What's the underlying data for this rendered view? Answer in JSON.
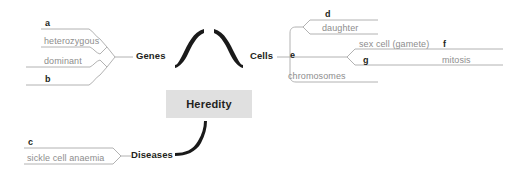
{
  "diagram": {
    "type": "mind-map",
    "title": "Heredity",
    "center": {
      "label": "Heredity",
      "fill": "#e0e0e0",
      "text_color": "#231f20"
    },
    "colors": {
      "center_fill": "#e0e0e0",
      "main_connector": "#1a1a1a",
      "leaf_line": "#a9a9a9",
      "leaf_text": "#8d8d8d",
      "main_text": "#231f20",
      "background": "#ffffff"
    },
    "branches": [
      {
        "label": "Genes",
        "side": "left",
        "children": [
          {
            "marker": "a",
            "text": "",
            "style": "marker-above"
          },
          {
            "marker": "",
            "text": "heterozygous",
            "style": "leaf"
          },
          {
            "marker": "",
            "text": "dominant",
            "style": "leaf"
          },
          {
            "marker": "b",
            "text": "",
            "style": "marker-below"
          }
        ]
      },
      {
        "label": "Cells",
        "side": "right",
        "children": [
          {
            "marker": "d",
            "text": "",
            "style": "marker-above"
          },
          {
            "marker": "",
            "text": "daughter",
            "style": "leaf"
          },
          {
            "marker": "e",
            "text": "",
            "style": "marker"
          },
          {
            "marker": "",
            "text": "chromosomes",
            "style": "leaf"
          }
        ],
        "nested": {
          "parent_marker": "e",
          "children": [
            {
              "marker": "f",
              "text": "sex cell (gamete)",
              "style": "leaf-then-marker"
            },
            {
              "marker": "g",
              "text": "mitosis",
              "style": "marker-then-leaf"
            }
          ]
        }
      },
      {
        "label": "Diseases",
        "side": "left",
        "children": [
          {
            "marker": "c",
            "text": "",
            "style": "marker-above"
          },
          {
            "marker": "",
            "text": "sickle cell anaemia",
            "style": "leaf"
          }
        ]
      }
    ],
    "labels": {
      "genes": "Genes",
      "cells": "Cells",
      "diseases": "Diseases",
      "heterozygous": "heterozygous",
      "dominant": "dominant",
      "daughter": "daughter",
      "chromosomes": "chromosomes",
      "sex_cell": "sex cell (gamete)",
      "mitosis": "mitosis",
      "marker_a": "a",
      "marker_b": "b",
      "marker_c": "c",
      "marker_d": "d",
      "marker_e": "e",
      "marker_f": "f",
      "marker_g": "g"
    }
  }
}
